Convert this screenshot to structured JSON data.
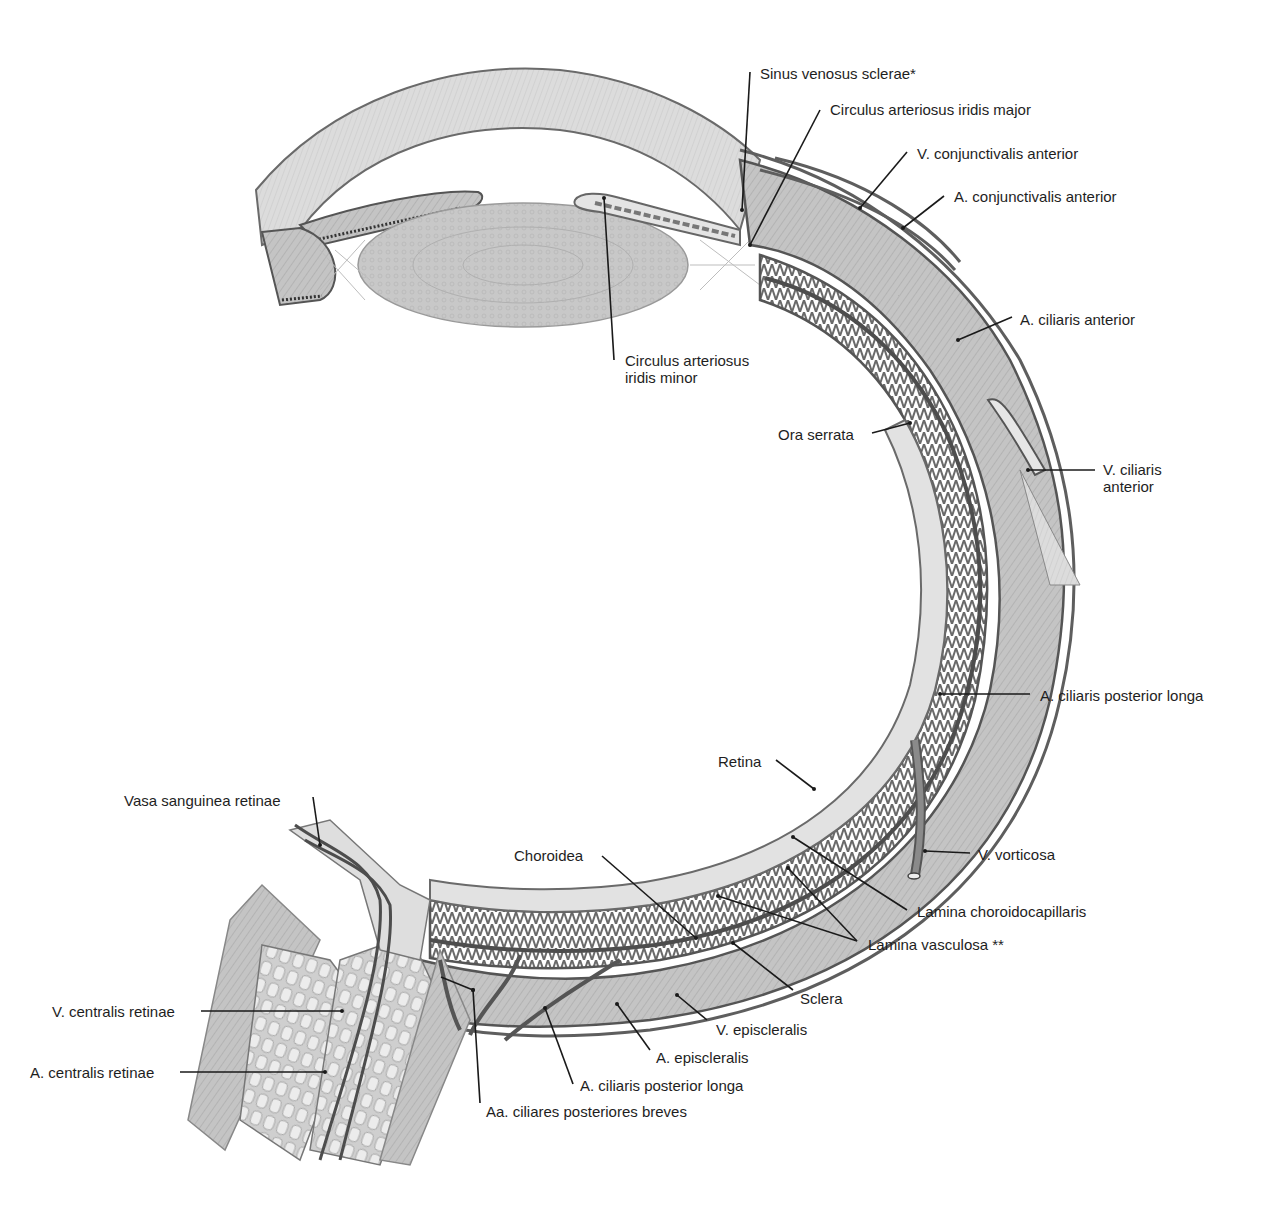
{
  "figure": {
    "colors": {
      "background": "#ffffff",
      "tissue_light": "#d9d9d9",
      "tissue_mid": "#b5b5b5",
      "tissue_dark": "#8c8c8c",
      "vessel": "#5a5a5a",
      "outline": "#4a4a4a",
      "leader_line": "#1a1a1a",
      "text": "#1e1e1e"
    }
  },
  "labels": [
    {
      "id": "sinus-venosus-sclerae",
      "text": "Sinus venosus sclerae*",
      "x": 760,
      "y": 65,
      "line": [
        [
          750,
          72
        ],
        [
          742,
          210
        ]
      ]
    },
    {
      "id": "circulus-arteriosus-iridis-major",
      "text": "Circulus arteriosus iridis major",
      "x": 830,
      "y": 101,
      "line": [
        [
          820,
          110
        ],
        [
          750,
          245
        ]
      ]
    },
    {
      "id": "v-conjunctivalis-anterior",
      "text": "V. conjunctivalis anterior",
      "x": 917,
      "y": 145,
      "line": [
        [
          907,
          152
        ],
        [
          860,
          208
        ]
      ]
    },
    {
      "id": "a-conjunctivalis-anterior",
      "text": "A. conjunctivalis anterior",
      "x": 954,
      "y": 188,
      "line": [
        [
          944,
          196
        ],
        [
          903,
          228
        ]
      ]
    },
    {
      "id": "circulus-arteriosus-iridis-minor",
      "text": "Circulus arteriosus\niridis minor",
      "x": 625,
      "y": 352,
      "line": [
        [
          614,
          360
        ],
        [
          604,
          198
        ]
      ]
    },
    {
      "id": "a-ciliaris-anterior",
      "text": "A. ciliaris anterior",
      "x": 1020,
      "y": 311,
      "line": [
        [
          1012,
          317
        ],
        [
          958,
          340
        ]
      ]
    },
    {
      "id": "ora-serrata",
      "text": "Ora serrata",
      "x": 778,
      "y": 426,
      "line": [
        [
          872,
          433
        ],
        [
          910,
          423
        ]
      ]
    },
    {
      "id": "v-ciliaris-anterior",
      "text": "V. ciliaris\nanterior",
      "x": 1103,
      "y": 461,
      "line": [
        [
          1095,
          470
        ],
        [
          1028,
          470
        ]
      ]
    },
    {
      "id": "a-ciliaris-posterior-longa-right",
      "text": "A. ciliaris posterior longa",
      "x": 1040,
      "y": 687,
      "line": [
        [
          1030,
          694
        ],
        [
          940,
          694
        ]
      ]
    },
    {
      "id": "retina",
      "text": "Retina",
      "x": 718,
      "y": 753,
      "line": [
        [
          776,
          760
        ],
        [
          814,
          789
        ]
      ]
    },
    {
      "id": "vasa-sanguinea-retinae",
      "text": "Vasa sanguinea retinae",
      "x": 124,
      "y": 792,
      "line": [
        [
          313,
          797
        ],
        [
          320,
          845
        ]
      ]
    },
    {
      "id": "v-vorticosa",
      "text": "V. vorticosa",
      "x": 978,
      "y": 846,
      "line": [
        [
          970,
          853
        ],
        [
          925,
          851
        ]
      ]
    },
    {
      "id": "choroidea",
      "text": "Choroidea",
      "x": 514,
      "y": 847,
      "line": [
        [
          602,
          856
        ],
        [
          696,
          938
        ]
      ]
    },
    {
      "id": "lamina-choroidocapillaris",
      "text": "Lamina choroidocapillaris",
      "x": 917,
      "y": 903,
      "line": [
        [
          907,
          910
        ],
        [
          793,
          837
        ]
      ]
    },
    {
      "id": "lamina-vasculosa",
      "text": "Lamina vasculosa **",
      "x": 868,
      "y": 936,
      "line": [
        [
          857,
          941
        ],
        [
          718,
          896
        ],
        [
          857,
          941
        ],
        [
          788,
          868
        ]
      ]
    },
    {
      "id": "sclera",
      "text": "Sclera",
      "x": 800,
      "y": 990,
      "line": [
        [
          793,
          990
        ],
        [
          733,
          943
        ]
      ]
    },
    {
      "id": "v-centralis-retinae",
      "text": "V. centralis retinae",
      "x": 52,
      "y": 1003,
      "line": [
        [
          201,
          1011
        ],
        [
          342,
          1011
        ]
      ]
    },
    {
      "id": "v-episcleralis",
      "text": "V. episcleralis",
      "x": 716,
      "y": 1021,
      "line": [
        [
          707,
          1020
        ],
        [
          677,
          995
        ]
      ]
    },
    {
      "id": "a-episcleralis",
      "text": "A. episcleralis",
      "x": 656,
      "y": 1049,
      "line": [
        [
          650,
          1050
        ],
        [
          617,
          1004
        ]
      ]
    },
    {
      "id": "a-centralis-retinae",
      "text": "A. centralis retinae",
      "x": 30,
      "y": 1064,
      "line": [
        [
          180,
          1072
        ],
        [
          325,
          1072
        ]
      ]
    },
    {
      "id": "a-ciliaris-posterior-longa-bottom",
      "text": "A. ciliaris posterior longa",
      "x": 580,
      "y": 1077,
      "line": [
        [
          573,
          1084
        ],
        [
          545,
          1008
        ]
      ]
    },
    {
      "id": "aa-ciliares-posteriores-breves",
      "text": "Aa. ciliares posteriores breves",
      "x": 486,
      "y": 1103,
      "line": [
        [
          480,
          1103
        ],
        [
          473,
          990
        ],
        [
          441,
          977
        ],
        [
          473,
          990
        ],
        [
          514,
          975
        ]
      ]
    }
  ]
}
